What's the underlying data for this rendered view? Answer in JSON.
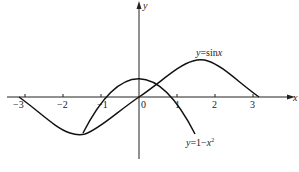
{
  "figure": {
    "axes": {
      "x_label": "x",
      "y_label": "y",
      "origin_label": "0",
      "x_ticks": [
        {
          "value": -3,
          "label": "−3"
        },
        {
          "value": -2,
          "label": "−2"
        },
        {
          "value": -1,
          "label": "−1"
        },
        {
          "value": 1,
          "label": "1"
        },
        {
          "value": 2,
          "label": "2"
        },
        {
          "value": 3,
          "label": "3"
        }
      ]
    },
    "curves": [
      {
        "name": "sine",
        "label_y": "y",
        "label_eq": "=sin",
        "label_var": "x"
      },
      {
        "name": "parabola",
        "label_y": "y",
        "label_eq": "=1−",
        "label_var": "x",
        "label_sup": "2"
      }
    ],
    "colors": {
      "line": "#111111",
      "background": "#ffffff"
    }
  }
}
